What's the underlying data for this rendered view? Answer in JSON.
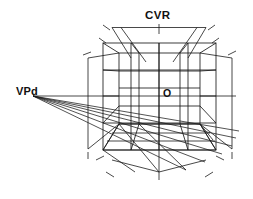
{
  "figure": {
    "kind": "one-point-perspective-grid",
    "background_color": "#ffffff",
    "line_color": "#1a1a1a",
    "canvas": {
      "width": 253,
      "height": 199
    }
  },
  "labels": {
    "cvr": "CVR",
    "vpd": "VPd",
    "origin": "O"
  },
  "label_positions": {
    "cvr": {
      "x": 145,
      "y": 19
    },
    "vpd": {
      "x": 16,
      "y": 95
    },
    "origin": {
      "x": 163,
      "y": 97
    }
  },
  "points": {
    "vanishing_point_diagonal": {
      "x": 33,
      "y": 96
    },
    "center_of_vision": {
      "x": 159,
      "y": 96
    },
    "horizon_left": {
      "x": 33,
      "y": 96
    },
    "horizon_right": {
      "x": 236,
      "y": 96
    }
  },
  "front_face": {
    "label": "front picture plane square",
    "left": 103,
    "right": 216,
    "top": 43,
    "bottom": 150,
    "divisions": 4
  },
  "back_face": {
    "label": "back wall square",
    "left": 119,
    "right": 200,
    "top": 53,
    "bottom": 124,
    "divisions": 4
  },
  "measuring_lines": {
    "top_horizontal_y": 27,
    "top_horizontal_x1": 112,
    "top_horizontal_x2": 206,
    "left_vertical_x": 88,
    "right_vertical_x": 232,
    "vertical_y1": 57,
    "vertical_y2": 150,
    "bottom_horizontal_y": 176,
    "bottom_horizontal_x1": 112,
    "bottom_horizontal_x2": 206
  },
  "fan_lines": {
    "count": 6,
    "description": "diagonal rays converging at VPd across the floor grid"
  }
}
